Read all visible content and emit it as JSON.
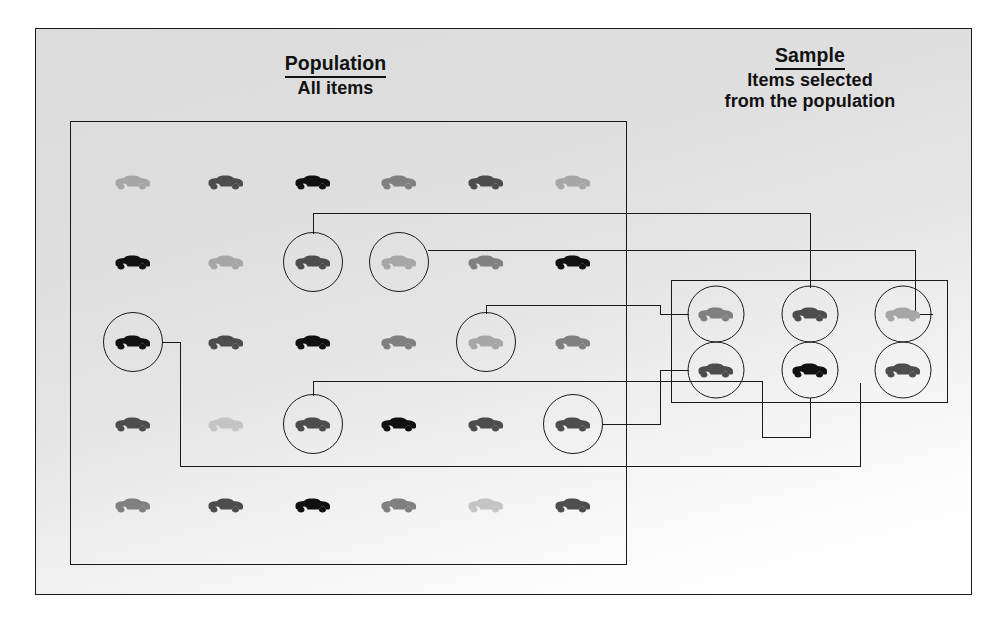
{
  "figure": {
    "type": "diagram",
    "background_color": "#e4e4e4",
    "line_color": "#1a1a1a"
  },
  "labels": {
    "population": {
      "title": "Population",
      "subtitle": "All items"
    },
    "sample": {
      "title": "Sample",
      "subtitle_line1": "Items selected",
      "subtitle_line2": "from the population"
    }
  },
  "palette": {
    "black": "#111111",
    "dark_gray": "#4d4d4d",
    "medium_gray": "#808080",
    "light_gray": "#a6a6a6",
    "pale_gray": "#c4c4c4"
  },
  "population_grid": {
    "rows": 5,
    "cols": 6,
    "icon": "car-icon",
    "items": [
      [
        {
          "shade": "light_gray",
          "selected": false
        },
        {
          "shade": "dark_gray",
          "selected": false
        },
        {
          "shade": "black",
          "selected": false
        },
        {
          "shade": "medium_gray",
          "selected": false
        },
        {
          "shade": "dark_gray",
          "selected": false
        },
        {
          "shade": "light_gray",
          "selected": false
        }
      ],
      [
        {
          "shade": "black",
          "selected": false
        },
        {
          "shade": "light_gray",
          "selected": false
        },
        {
          "shade": "dark_gray",
          "selected": true
        },
        {
          "shade": "light_gray",
          "selected": true
        },
        {
          "shade": "medium_gray",
          "selected": false
        },
        {
          "shade": "black",
          "selected": false
        }
      ],
      [
        {
          "shade": "black",
          "selected": true
        },
        {
          "shade": "dark_gray",
          "selected": false
        },
        {
          "shade": "black",
          "selected": false
        },
        {
          "shade": "medium_gray",
          "selected": false
        },
        {
          "shade": "light_gray",
          "selected": true
        },
        {
          "shade": "medium_gray",
          "selected": false
        }
      ],
      [
        {
          "shade": "dark_gray",
          "selected": false
        },
        {
          "shade": "pale_gray",
          "selected": false
        },
        {
          "shade": "dark_gray",
          "selected": true
        },
        {
          "shade": "black",
          "selected": false
        },
        {
          "shade": "dark_gray",
          "selected": false
        },
        {
          "shade": "dark_gray",
          "selected": true
        }
      ],
      [
        {
          "shade": "medium_gray",
          "selected": false
        },
        {
          "shade": "dark_gray",
          "selected": false
        },
        {
          "shade": "black",
          "selected": false
        },
        {
          "shade": "medium_gray",
          "selected": false
        },
        {
          "shade": "pale_gray",
          "selected": false
        },
        {
          "shade": "dark_gray",
          "selected": false
        }
      ]
    ]
  },
  "sample_grid": {
    "rows": 2,
    "cols": 3,
    "icon": "car-icon",
    "items": [
      [
        {
          "shade": "medium_gray"
        },
        {
          "shade": "dark_gray"
        },
        {
          "shade": "light_gray"
        }
      ],
      [
        {
          "shade": "dark_gray"
        },
        {
          "shade": "black"
        },
        {
          "shade": "dark_gray"
        }
      ]
    ]
  },
  "connectors": {
    "count": 6,
    "description": "Each circled population item is linked by an orthogonal line to a circled item inside the sample box."
  }
}
